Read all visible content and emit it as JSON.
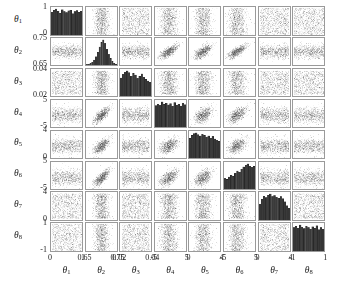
{
  "chart_data": {
    "type": "scatter",
    "title": "",
    "subtitle": "",
    "plot_kind": "corner-plot",
    "grid": false,
    "legend": null,
    "n_params": 8,
    "diagonal_type": "histogram",
    "offdiagonal_type": "scatter",
    "point_color": "#555555",
    "hist_color": "#3a3a3a",
    "frame_color": "#9a9a9a",
    "parameters": [
      {
        "index": 1,
        "label": "θ",
        "subscript": "1",
        "axis_label": "θ1",
        "ticks": [
          "0",
          "1"
        ],
        "tick_values": [
          0,
          1
        ],
        "range": [
          -0.05,
          1.05
        ],
        "distribution": "near-uniform",
        "hist_values": [
          0.88,
          0.95,
          1.0,
          0.92,
          0.83,
          0.97,
          0.9,
          0.86,
          0.93,
          0.96,
          0.82,
          0.9,
          0.94,
          0.87,
          0.91
        ]
      },
      {
        "index": 2,
        "label": "θ",
        "subscript": "2",
        "axis_label": "θ2",
        "ticks": [
          "0.65",
          "0.75"
        ],
        "tick_values": [
          0.65,
          0.75
        ],
        "range": [
          0.64,
          0.765
        ],
        "distribution": "sharply-peaked-triangular",
        "hist_values": [
          0.02,
          0.04,
          0.07,
          0.12,
          0.2,
          0.33,
          0.5,
          0.72,
          0.9,
          1.0,
          0.86,
          0.62,
          0.42,
          0.26,
          0.14,
          0.07,
          0.03
        ]
      },
      {
        "index": 3,
        "label": "θ",
        "subscript": "3",
        "axis_label": "θ3",
        "ticks": [
          "0.02",
          "0.04"
        ],
        "tick_values": [
          0.02,
          0.04
        ],
        "range": [
          0.0145,
          0.0455
        ],
        "distribution": "broad-flat",
        "hist_values": [
          0.72,
          0.86,
          0.95,
          1.0,
          0.93,
          0.8,
          0.9,
          0.84,
          0.7,
          0.78,
          0.88,
          0.74,
          0.66,
          0.6,
          0.55
        ]
      },
      {
        "index": 4,
        "label": "θ",
        "subscript": "4",
        "axis_label": "θ4",
        "ticks": [
          "-5",
          "5"
        ],
        "tick_values": [
          -5,
          5
        ],
        "range": [
          -6.2,
          6.2
        ],
        "distribution": "near-uniform",
        "hist_values": [
          0.85,
          0.92,
          0.86,
          1.0,
          0.9,
          0.95,
          0.88,
          0.93,
          0.83,
          0.97,
          0.87,
          0.91,
          0.84,
          0.96,
          0.89
        ]
      },
      {
        "index": 5,
        "label": "θ",
        "subscript": "5",
        "axis_label": "θ5",
        "ticks": [
          "0",
          "4"
        ],
        "tick_values": [
          0,
          4
        ],
        "range": [
          -0.45,
          4.45
        ],
        "distribution": "flat-declining",
        "hist_values": [
          0.78,
          0.9,
          0.97,
          1.0,
          0.93,
          0.88,
          0.95,
          0.9,
          0.84,
          0.88,
          0.8,
          0.86,
          0.76,
          0.7,
          0.66
        ]
      },
      {
        "index": 6,
        "label": "θ",
        "subscript": "6",
        "axis_label": "θ6",
        "ticks": [
          "-5",
          "5"
        ],
        "tick_values": [
          -5,
          5
        ],
        "range": [
          -6.2,
          6.2
        ],
        "distribution": "rising-to-right",
        "hist_values": [
          0.42,
          0.38,
          0.48,
          0.55,
          0.5,
          0.62,
          0.72,
          0.68,
          0.8,
          0.88,
          0.95,
          1.0,
          0.92,
          0.86,
          0.9
        ]
      },
      {
        "index": 7,
        "label": "θ",
        "subscript": "7",
        "axis_label": "θ7",
        "ticks": [
          "0",
          "4"
        ],
        "tick_values": [
          0,
          4
        ],
        "range": [
          -0.45,
          4.45
        ],
        "distribution": "broad-peaked-left",
        "hist_values": [
          0.62,
          0.8,
          0.92,
          0.86,
          0.95,
          1.0,
          0.9,
          0.94,
          0.88,
          0.84,
          0.9,
          0.82,
          0.7,
          0.55,
          0.46
        ]
      },
      {
        "index": 8,
        "label": "θ",
        "subscript": "8",
        "axis_label": "θ8",
        "ticks": [
          "-1",
          "1"
        ],
        "tick_values": [
          -1,
          1
        ],
        "range": [
          -1.12,
          1.12
        ],
        "distribution": "near-uniform",
        "hist_values": [
          0.9,
          0.95,
          0.88,
          1.0,
          0.92,
          0.86,
          0.96,
          0.9,
          0.84,
          0.93,
          0.87,
          0.97,
          0.82,
          0.9,
          0.85
        ]
      }
    ],
    "correlations": [
      {
        "row": 2,
        "col": 1,
        "shape": "uniform-cloud",
        "rho": 0.0
      },
      {
        "row": 4,
        "col": 2,
        "shape": "curved-banana",
        "rho": 0.62
      },
      {
        "row": 5,
        "col": 2,
        "shape": "curved-banana",
        "rho": 0.55
      },
      {
        "row": 6,
        "col": 2,
        "shape": "curved-banana",
        "rho": 0.58
      },
      {
        "row": 7,
        "col": 2,
        "shape": "vertical-band",
        "rho": 0.2
      },
      {
        "row": 3,
        "col": 2,
        "shape": "vertical-band",
        "rho": 0.15
      },
      {
        "row": 8,
        "col": 2,
        "shape": "vertical-band",
        "rho": 0.1
      }
    ],
    "xlabel": "",
    "ylabel": ""
  },
  "axes": {
    "y_ticks": [
      {
        "top": "1",
        "bottom": "0"
      },
      {
        "top": "0.75",
        "bottom": "0.65"
      },
      {
        "top": "0.04",
        "bottom": "0.02"
      },
      {
        "top": "5",
        "bottom": "-5"
      },
      {
        "top": "4",
        "bottom": "0"
      },
      {
        "top": "5",
        "bottom": "-5"
      },
      {
        "top": "4",
        "bottom": "0"
      },
      {
        "top": "1",
        "bottom": "-1"
      }
    ],
    "x_ticks": [
      {
        "left": "0",
        "right": "1"
      },
      {
        "left": "0.65",
        "right": "0.75"
      },
      {
        "left": "0.02",
        "right": "0.04"
      },
      {
        "left": "-5",
        "right": "5"
      },
      {
        "left": "0",
        "right": "4"
      },
      {
        "left": "-5",
        "right": "5"
      },
      {
        "left": "0",
        "right": "4"
      },
      {
        "left": "-1",
        "right": "1"
      }
    ]
  }
}
